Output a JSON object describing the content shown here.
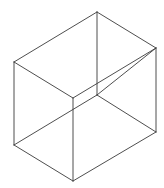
{
  "figure": {
    "type": "wireframe-box",
    "width": 164,
    "height": 188,
    "background": "#ffffff",
    "stroke_color": "#3a3a3a",
    "stroke_width": 0.9,
    "vertices": {
      "top_back": [
        97,
        12
      ],
      "top_left": [
        14,
        62
      ],
      "top_right": [
        156,
        48
      ],
      "top_front": [
        73,
        98
      ],
      "bottom_back": [
        97,
        95
      ],
      "bottom_left": [
        14,
        145
      ],
      "bottom_right": [
        156,
        132
      ],
      "bottom_front": [
        73,
        181
      ]
    },
    "edges": [
      [
        "top_back",
        "top_left"
      ],
      [
        "top_back",
        "top_right"
      ],
      [
        "top_left",
        "top_front"
      ],
      [
        "top_right",
        "bottom_back"
      ],
      [
        "top_back",
        "bottom_back"
      ],
      [
        "top_left",
        "bottom_left"
      ],
      [
        "top_right",
        "bottom_right"
      ],
      [
        "top_front",
        "bottom_front"
      ],
      [
        "bottom_left",
        "bottom_front"
      ],
      [
        "bottom_front",
        "bottom_right"
      ],
      [
        "bottom_back",
        "bottom_right"
      ],
      [
        "bottom_back",
        "bottom_left"
      ],
      [
        "top_front",
        "top_right"
      ]
    ]
  }
}
